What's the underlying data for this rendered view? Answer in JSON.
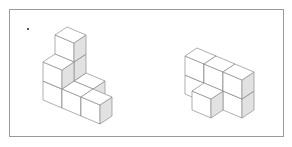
{
  "diagram": {
    "title": "",
    "frame_color": "#9a9a9a",
    "shade_color": "#e2e2e2",
    "edge_color": "#8c8c8c",
    "projection": {
      "X": [
        19,
        8
      ],
      "Y": [
        12,
        -8
      ],
      "Z": [
        0,
        -19
      ]
    },
    "figures": [
      {
        "name": "left-cube-structure",
        "origin": [
          74,
          81
        ],
        "cube_count": 8,
        "cubes": [
          [
            0,
            0,
            0
          ],
          [
            0,
            0,
            1
          ],
          [
            0,
            0,
            2
          ],
          [
            1,
            0,
            0
          ],
          [
            0,
            -1,
            0
          ],
          [
            0,
            -1,
            1
          ],
          [
            1,
            -1,
            0
          ],
          [
            2,
            -1,
            0
          ]
        ]
      },
      {
        "name": "right-cube-structure",
        "origin": [
          204,
          83
        ],
        "cube_count": 7,
        "cubes": [
          [
            0,
            0,
            0
          ],
          [
            1,
            0,
            0
          ],
          [
            2,
            0,
            0
          ],
          [
            0,
            0,
            1
          ],
          [
            1,
            0,
            1
          ],
          [
            2,
            0,
            1
          ],
          [
            1,
            -1,
            0
          ]
        ]
      }
    ]
  }
}
